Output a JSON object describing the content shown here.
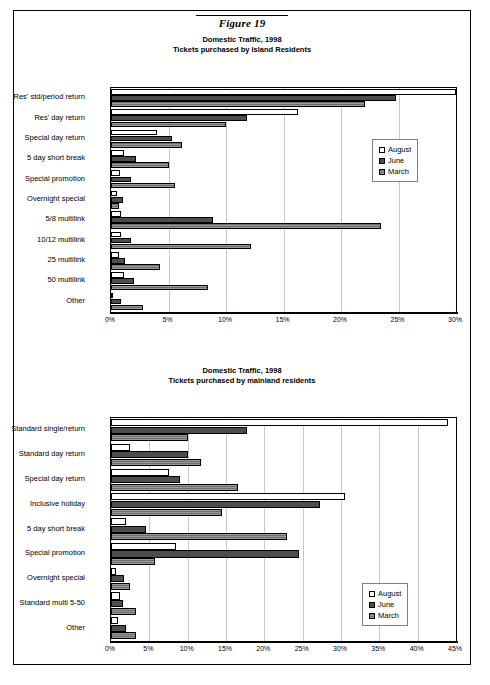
{
  "figure": {
    "caption": "Figure 19"
  },
  "charts": [
    {
      "id": "island-residents",
      "title_line1": "Domestic Traffic, 1998",
      "title_line2": "Tickets purchased by Island Residents",
      "legend": [
        {
          "label": "August",
          "swatch": "august"
        },
        {
          "label": "June",
          "swatch": "june"
        },
        {
          "label": "March",
          "swatch": "march"
        }
      ],
      "chart_data": {
        "type": "bar",
        "orientation": "horizontal",
        "title": "Domestic Traffic, 1998 - Tickets purchased by Island Residents",
        "xlabel": "",
        "ylabel": "",
        "xlim": [
          0,
          30
        ],
        "xticks": [
          "0%",
          "5%",
          "10%",
          "15%",
          "20%",
          "25%",
          "30%"
        ],
        "grid": true,
        "legend_position": "middle-right",
        "categories": [
          "Res' std/period return",
          "Res' day return",
          "Special day return",
          "5 day short break",
          "Special promotion",
          "Overnight special",
          "5/8 multilink",
          "10/12 multilink",
          "25 multilink",
          "50 multilink",
          "Other"
        ],
        "series": [
          {
            "name": "August",
            "values": [
              30.0,
              16.3,
              4.0,
              1.1,
              0.8,
              0.5,
              0.9,
              0.9,
              0.7,
              1.1,
              0.2
            ]
          },
          {
            "name": "June",
            "values": [
              24.8,
              11.8,
              5.3,
              2.2,
              1.7,
              1.0,
              8.9,
              1.7,
              1.2,
              2.0,
              0.9
            ]
          },
          {
            "name": "March",
            "values": [
              22.1,
              10.0,
              6.2,
              5.0,
              5.6,
              0.7,
              23.5,
              12.2,
              4.3,
              8.4,
              2.8
            ]
          }
        ]
      }
    },
    {
      "id": "mainland-residents",
      "title_line1": "Domestic Traffic, 1998",
      "title_line2": "Tickets purchased by mainland residents",
      "legend": [
        {
          "label": "August",
          "swatch": "august"
        },
        {
          "label": "June",
          "swatch": "june"
        },
        {
          "label": "March",
          "swatch": "march"
        }
      ],
      "chart_data": {
        "type": "bar",
        "orientation": "horizontal",
        "title": "Domestic Traffic, 1998 - Tickets purchased by mainland residents",
        "xlabel": "",
        "ylabel": "",
        "xlim": [
          0,
          45
        ],
        "xticks": [
          "0%",
          "5%",
          "10%",
          "15%",
          "20%",
          "25%",
          "30%",
          "35%",
          "40%",
          "45%"
        ],
        "grid": true,
        "legend_position": "lower-right",
        "categories": [
          "Standard single/return",
          "Standard day return",
          "Special day return",
          "Inclusive holiday",
          "5 day short break",
          "Special promotion",
          "Overnight special",
          "Standard multi 5-50",
          "Other"
        ],
        "series": [
          {
            "name": "August",
            "values": [
              44.0,
              2.5,
              7.5,
              30.5,
              2.0,
              8.5,
              0.7,
              1.2,
              0.9
            ]
          },
          {
            "name": "June",
            "values": [
              17.8,
              10.0,
              9.0,
              27.2,
              4.5,
              24.5,
              1.7,
              1.5,
              1.9
            ]
          },
          {
            "name": "March",
            "values": [
              10.0,
              11.8,
              16.5,
              14.5,
              23.0,
              5.8,
              2.5,
              3.2,
              3.3
            ]
          }
        ]
      }
    }
  ]
}
